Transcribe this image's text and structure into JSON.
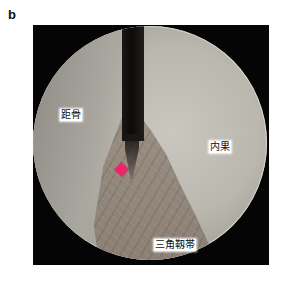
{
  "figure": {
    "panel_label": "b",
    "image_type": "arthroscopic-view",
    "labels": {
      "talus": "距骨",
      "medial_malleolus": "内果",
      "deltoid_ligament": "三角靱帯"
    },
    "marker": {
      "shape": "diamond",
      "color": "#f0246a"
    },
    "colors": {
      "frame": "#050505",
      "bone_surface": "#bdbbb3",
      "ligament": "#8f8377",
      "instrument": "#0f0d0b"
    }
  }
}
